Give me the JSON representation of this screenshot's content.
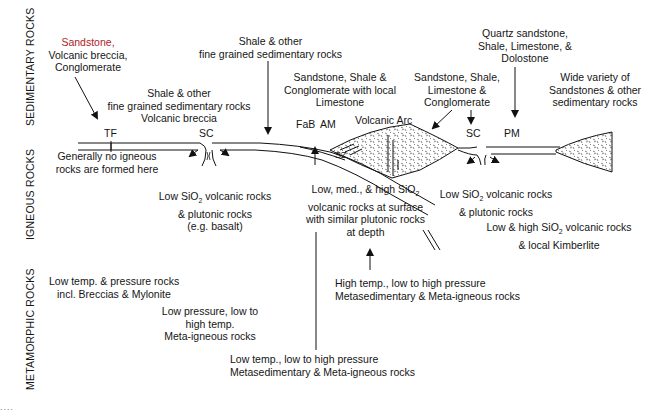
{
  "side_labels": {
    "sedimentary": "SEDIMENTARY ROCKS",
    "igneous": "IGNEOUS ROCKS",
    "metamorphic": "METAMORPHIC ROCKS"
  },
  "settings": {
    "TF": "TF",
    "SC_left": "SC",
    "FaB": "FaB",
    "AM": "AM",
    "volcanic_arc": "Volcanic Arc",
    "SZ": "SZ",
    "SC_right": "SC",
    "PM": "PM"
  },
  "sedimentary": {
    "tf": {
      "first": "Sandstone,",
      "line2": "Volcanic breccia,",
      "line3": "Conglomerate"
    },
    "sc_left": {
      "line1": "Shale & other",
      "line2": "fine grained sedimentary rocks",
      "line3": "Volcanic breccia"
    },
    "ocean_floor": {
      "line1": "Shale & other",
      "line2": "fine grained sedimentary rocks"
    },
    "forearc": {
      "line1": "Sandstone, Shale &",
      "line2": "Conglomerate with local",
      "line3": "Limestone"
    },
    "arc_side": {
      "line1": "Sandstone, Shale,",
      "line2": "Limestone &",
      "line3": "Conglomerate"
    },
    "passive_margin": {
      "line1": "Quartz sandstone,",
      "line2": "Shale, Limestone, &",
      "line3": "Dolostone"
    },
    "continent": {
      "line1": "Wide variety of",
      "line2": "Sandstones & other",
      "line3": "sedimentary rocks"
    }
  },
  "igneous": {
    "tf": {
      "line1": "Generally no igneous",
      "line2": "rocks are formed here"
    },
    "sc_left": {
      "line1a": "Low SiO",
      "line1sub": "2",
      "line1b": " volcanic rocks",
      "line2": "& plutonic rocks",
      "line3": "(e.g. basalt)"
    },
    "arc": {
      "line1a": "Low, med., & high SiO",
      "line1sub": "2",
      "line2": "volcanic rocks at surface",
      "line3": "with similar plutonic rocks",
      "line4": "at depth"
    },
    "sc_right": {
      "line1a": "Low SiO",
      "line1sub": "2",
      "line1b": " volcanic rocks",
      "line2": "& plutonic rocks"
    },
    "continent": {
      "line1a": "Low & high SiO",
      "line1sub": "2",
      "line1b": " volcanic rocks",
      "line2": "& local Kimberlite"
    }
  },
  "metamorphic": {
    "low_temp_pressure": {
      "line1": "Low temp. & pressure rocks",
      "line2": "incl. Breccias & Mylonite"
    },
    "low_pressure": {
      "line1": "Low pressure, low to",
      "line2": "high temp.",
      "line3": "Meta-igneous rocks"
    },
    "low_temp": {
      "line1": "Low temp., low to high pressure",
      "line2": "Metasedimentary & Meta-igneous rocks"
    },
    "high_temp": {
      "line1": "High temp., low to high pressure",
      "line2": "Metasedimentary & Meta-igneous rocks"
    }
  },
  "footer": {
    "dots": "...."
  }
}
